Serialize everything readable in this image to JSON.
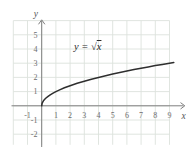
{
  "chart_data": {
    "type": "line",
    "title": "",
    "annotation": "y = √x",
    "xlabel": "x",
    "ylabel": "y",
    "grid": true,
    "grid_xlim": [
      -2,
      9
    ],
    "grid_ylim": [
      -2.75,
      6
    ],
    "x_ticks": [
      -1,
      1,
      2,
      3,
      4,
      5,
      6,
      7,
      8,
      9
    ],
    "y_ticks": [
      5,
      4,
      3,
      2,
      1,
      -1,
      -2
    ],
    "x": [
      0,
      0.02,
      0.06,
      0.12,
      0.2,
      0.3,
      0.45,
      0.6,
      0.8,
      1,
      1.3,
      1.6,
      2,
      2.5,
      3,
      3.5,
      4,
      4.5,
      5,
      5.5,
      6,
      6.5,
      7,
      7.5,
      8,
      8.5,
      9,
      9.3
    ],
    "y": [
      0,
      0.141,
      0.245,
      0.346,
      0.447,
      0.548,
      0.671,
      0.775,
      0.894,
      1,
      1.14,
      1.265,
      1.414,
      1.581,
      1.732,
      1.871,
      2,
      2.121,
      2.236,
      2.345,
      2.449,
      2.55,
      2.646,
      2.739,
      2.828,
      2.915,
      3,
      3.05
    ]
  },
  "equation": {
    "lhs": "y = ",
    "radical_sign": "√",
    "radicand": "x"
  },
  "colors": {
    "background": "#ffffff",
    "grid": "#dde2dd",
    "axis": "#7f7f7f",
    "tick_text": "#6d6d6d",
    "curve": "#2e2e2e",
    "equation_text": "#2b2b2b"
  }
}
